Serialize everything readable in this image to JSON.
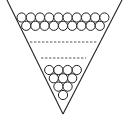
{
  "diagram": {
    "title": "Circles stacked in an inverted triangle (triangular number arrangement)",
    "colors": {
      "stroke": "#222222",
      "background": "#ffffff",
      "fill": "#ffffff"
    },
    "triangle": {
      "left_top": [
        7,
        0
      ],
      "right_top": [
        122,
        0
      ],
      "apex": [
        63,
        114
      ]
    },
    "circle_radius": 4.6,
    "rows": [
      {
        "count": 10,
        "cy": 17.5,
        "x_start": 21.6
      },
      {
        "count": 9,
        "cy": 25.8,
        "x_start": 26.2
      },
      {
        "count": 4,
        "cy": 70.0,
        "x_start": 49.2
      },
      {
        "count": 3,
        "cy": 78.3,
        "x_start": 53.8
      },
      {
        "count": 2,
        "cy": 86.6,
        "x_start": 58.4
      },
      {
        "count": 1,
        "cy": 95.0,
        "x_start": 63.0
      }
    ],
    "circle_spacing": 9.2,
    "dashed_lines": [
      {
        "x1": 30,
        "x2": 97,
        "y": 42
      },
      {
        "x1": 41,
        "x2": 86,
        "y": 58
      }
    ]
  }
}
